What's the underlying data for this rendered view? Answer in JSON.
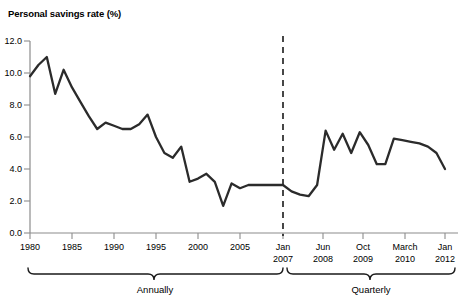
{
  "chart_data": {
    "type": "line",
    "title": "Personal savings rate (%)",
    "xlabel": "",
    "ylabel": "",
    "ylim": [
      0.0,
      12.0
    ],
    "yticks": [
      "0.0",
      "2.0",
      "4.0",
      "6.0",
      "8.0",
      "10.0",
      "12.0"
    ],
    "ytick_values": [
      0.0,
      2.0,
      4.0,
      6.0,
      8.0,
      10.0,
      12.0
    ],
    "grid": false,
    "legend": "none",
    "line_color": "#2b2b2b",
    "axis_color": "#8c8c8c",
    "xtick_labels": [
      "1980",
      "1985",
      "1990",
      "1995",
      "2000",
      "2005",
      "Jan\n2007",
      "Jun\n2008",
      "Oct\n2009",
      "March\n2010",
      "Jan\n2012"
    ],
    "xticks_annual": [
      {
        "label": "1980",
        "value": 1980
      },
      {
        "label": "1985",
        "value": 1985
      },
      {
        "label": "1990",
        "value": 1990
      },
      {
        "label": "1995",
        "value": 1995
      },
      {
        "label": "2000",
        "value": 2000
      },
      {
        "label": "2005",
        "value": 2005
      }
    ],
    "xticks_quarterly": [
      {
        "line1": "Jan",
        "line2": "2007"
      },
      {
        "line1": "Jun",
        "line2": "2008"
      },
      {
        "line1": "Oct",
        "line2": "2009"
      },
      {
        "line1": "March",
        "line2": "2010"
      },
      {
        "line1": "Jan",
        "line2": "2012"
      }
    ],
    "divider": {
      "label": "Jan 2007",
      "style": "dashed",
      "note": "separates annual data from quarterly data"
    },
    "bands": [
      {
        "label": "Annually",
        "from": "1980",
        "to": "Jan 2007"
      },
      {
        "label": "Quarterly",
        "from": "Jan 2007",
        "to": "Jan 2012"
      }
    ],
    "series": [
      {
        "name": "Personal savings rate",
        "segment": "annual",
        "x": [
          1980,
          1981,
          1982,
          1983,
          1984,
          1985,
          1986,
          1987,
          1988,
          1989,
          1990,
          1991,
          1992,
          1993,
          1994,
          1995,
          1996,
          1997,
          1998,
          1999,
          2000,
          2001,
          2002,
          2003,
          2004,
          2005,
          2006
        ],
        "values": [
          9.8,
          10.5,
          11.0,
          8.7,
          10.2,
          9.1,
          8.2,
          7.3,
          6.5,
          6.9,
          6.7,
          6.5,
          6.5,
          6.8,
          7.4,
          6.0,
          5.0,
          4.7,
          5.4,
          3.2,
          3.4,
          3.7,
          3.2,
          1.7,
          3.1,
          2.8,
          3.0
        ]
      },
      {
        "name": "Personal savings rate",
        "segment": "quarterly",
        "x": [
          "Jan 2007",
          "Q2 2007",
          "Q3 2007",
          "Q4 2007",
          "Q1 2008",
          "Jun 2008",
          "Q3 2008",
          "Q4 2008",
          "Q1 2009",
          "Q2 2009",
          "Q3 2009",
          "Oct 2009",
          "Q1 2010",
          "March 2010",
          "Q3 2010",
          "Q4 2010",
          "Q1 2011",
          "Q2 2011",
          "Q3 2011",
          "Jan 2012"
        ],
        "values": [
          3.0,
          2.6,
          2.4,
          2.3,
          3.0,
          6.4,
          5.2,
          6.2,
          5.0,
          6.3,
          5.5,
          4.3,
          4.3,
          5.9,
          5.8,
          5.7,
          5.6,
          5.4,
          5.0,
          4.0
        ]
      }
    ]
  },
  "figure": {
    "title": "Personal savings rate (%)"
  }
}
